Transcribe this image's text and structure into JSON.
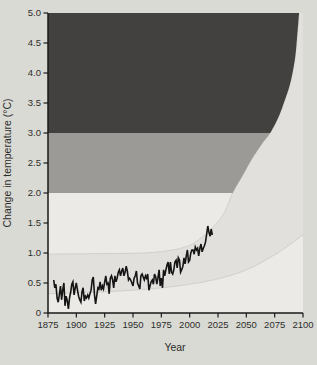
{
  "figure": {
    "background": "#d9dad4"
  },
  "chart_data": {
    "type": "line",
    "title": "",
    "xlabel": "Year",
    "ylabel": "Change in temperature (°C)",
    "xlim": [
      1875,
      2100
    ],
    "ylim": [
      0,
      5
    ],
    "grid": false,
    "legend": null,
    "x_ticks": [
      1875,
      1900,
      1925,
      1950,
      1975,
      2000,
      2025,
      2050,
      2075,
      2100
    ],
    "x_tick_labels": [
      "1875",
      "1900",
      "1925",
      "1950",
      "1975",
      "2000",
      "2025",
      "2050",
      "2075",
      "2100"
    ],
    "y_ticks": [
      0,
      0.5,
      1.0,
      1.5,
      2.0,
      2.5,
      3.0,
      3.5,
      4.0,
      4.5,
      5.0
    ],
    "y_tick_labels": [
      "0",
      "0.5",
      "1.0",
      "1.5",
      "2.0",
      "2.5",
      "3.0",
      "3.5",
      "4.0",
      "4.5",
      "5.0"
    ],
    "colors": {
      "plot_bg": "#eceae6",
      "projection_fan": "#e2e0dc",
      "fan_edge": "#d1cfc9",
      "band_2_3": "#9b9a96",
      "band_3_5": "#424140",
      "observed_line": "#151515",
      "axis": "#1a1a1a",
      "text": "#2d2d2b"
    },
    "temperature_bands": [
      {
        "name": "band-3-5C",
        "from": 3.0,
        "to": 5.0,
        "color_key": "band_3_5"
      },
      {
        "name": "band-2-3C",
        "from": 2.0,
        "to": 3.0,
        "color_key": "band_2_3"
      }
    ],
    "projection_upper_curve": {
      "x": [
        1875,
        1920,
        1960,
        1985,
        2000,
        2010,
        2020,
        2030,
        2038,
        2047,
        2056,
        2065,
        2071,
        2078,
        2084,
        2089,
        2093,
        2095,
        2096.5
      ],
      "y": [
        0.98,
        0.99,
        1.0,
        1.05,
        1.13,
        1.25,
        1.42,
        1.65,
        2.0,
        2.3,
        2.6,
        2.85,
        3.0,
        3.25,
        3.55,
        3.85,
        4.25,
        4.65,
        5.0
      ]
    },
    "projection_lower_curve": {
      "x": [
        1875,
        1920,
        1950,
        1975,
        2000,
        2025,
        2050,
        2075,
        2100
      ],
      "y": [
        0.32,
        0.35,
        0.38,
        0.42,
        0.48,
        0.57,
        0.72,
        0.97,
        1.3
      ]
    },
    "series": [
      {
        "name": "observed-temperature-change",
        "x": [
          1880,
          1881,
          1882,
          1883,
          1884,
          1885,
          1886,
          1887,
          1888,
          1889,
          1890,
          1891,
          1892,
          1893,
          1894,
          1895,
          1896,
          1897,
          1898,
          1899,
          1900,
          1901,
          1902,
          1903,
          1904,
          1905,
          1906,
          1907,
          1908,
          1909,
          1910,
          1911,
          1912,
          1913,
          1914,
          1915,
          1916,
          1917,
          1918,
          1919,
          1920,
          1921,
          1922,
          1923,
          1924,
          1925,
          1926,
          1927,
          1928,
          1929,
          1930,
          1931,
          1932,
          1933,
          1934,
          1935,
          1936,
          1937,
          1938,
          1939,
          1940,
          1941,
          1942,
          1943,
          1944,
          1945,
          1946,
          1947,
          1948,
          1949,
          1950,
          1951,
          1952,
          1953,
          1954,
          1955,
          1956,
          1957,
          1958,
          1959,
          1960,
          1961,
          1962,
          1963,
          1964,
          1965,
          1966,
          1967,
          1968,
          1969,
          1970,
          1971,
          1972,
          1973,
          1974,
          1975,
          1976,
          1977,
          1978,
          1979,
          1980,
          1981,
          1982,
          1983,
          1984,
          1985,
          1986,
          1987,
          1988,
          1989,
          1990,
          1991,
          1992,
          1993,
          1994,
          1995,
          1996,
          1997,
          1998,
          1999,
          2000,
          2001,
          2002,
          2003,
          2004,
          2005,
          2006,
          2007,
          2008,
          2009,
          2010,
          2011,
          2012,
          2013,
          2014,
          2015,
          2016,
          2017,
          2018,
          2019,
          2020
        ],
        "y": [
          0.55,
          0.42,
          0.48,
          0.25,
          0.18,
          0.3,
          0.45,
          0.22,
          0.38,
          0.5,
          0.12,
          0.28,
          0.2,
          0.07,
          0.25,
          0.35,
          0.48,
          0.52,
          0.3,
          0.42,
          0.5,
          0.38,
          0.28,
          0.22,
          0.18,
          0.35,
          0.42,
          0.2,
          0.28,
          0.25,
          0.3,
          0.25,
          0.32,
          0.38,
          0.55,
          0.6,
          0.3,
          0.15,
          0.28,
          0.42,
          0.4,
          0.52,
          0.38,
          0.45,
          0.4,
          0.52,
          0.62,
          0.48,
          0.5,
          0.32,
          0.58,
          0.62,
          0.55,
          0.42,
          0.62,
          0.52,
          0.58,
          0.68,
          0.72,
          0.62,
          0.7,
          0.75,
          0.62,
          0.68,
          0.78,
          0.7,
          0.55,
          0.58,
          0.55,
          0.5,
          0.45,
          0.58,
          0.62,
          0.7,
          0.5,
          0.45,
          0.4,
          0.62,
          0.65,
          0.6,
          0.55,
          0.62,
          0.58,
          0.65,
          0.38,
          0.45,
          0.52,
          0.55,
          0.48,
          0.65,
          0.6,
          0.48,
          0.58,
          0.72,
          0.45,
          0.58,
          0.42,
          0.72,
          0.62,
          0.72,
          0.8,
          0.85,
          0.65,
          0.85,
          0.68,
          0.65,
          0.72,
          0.85,
          0.88,
          0.75,
          0.92,
          0.88,
          0.68,
          0.72,
          0.78,
          0.92,
          0.82,
          0.95,
          1.05,
          0.85,
          0.88,
          1.0,
          1.05,
          1.05,
          0.98,
          1.1,
          1.05,
          1.08,
          0.95,
          1.08,
          1.15,
          1.02,
          1.08,
          1.12,
          1.18,
          1.32,
          1.45,
          1.35,
          1.28,
          1.4,
          1.3
        ]
      }
    ]
  }
}
